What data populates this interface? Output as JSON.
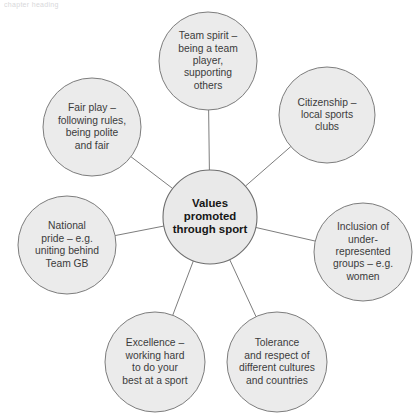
{
  "page": {
    "header_fragment": "chapter heading",
    "background_color": "#ffffff"
  },
  "diagram": {
    "type": "spider-radial",
    "node_fill_color": "#ebebeb",
    "node_stroke_color": "#7d7d7d",
    "text_color": "#3b3b3b",
    "center_text_color": "#161616",
    "center": {
      "label_lines": [
        "Values",
        "promoted",
        "through sport"
      ],
      "cx": 210,
      "cy": 217,
      "r": 47
    },
    "nodes": [
      {
        "id": "team-spirit",
        "label_lines": [
          "Team spirit –",
          "being a team",
          "player,",
          "supporting",
          "others"
        ],
        "cx": 208,
        "cy": 61,
        "r": 49
      },
      {
        "id": "citizenship",
        "label_lines": [
          "Citizenship –",
          "local sports",
          "clubs"
        ],
        "cx": 327,
        "cy": 115,
        "r": 48
      },
      {
        "id": "inclusion",
        "label_lines": [
          "Inclusion of",
          "under-",
          "represented",
          "groups – e.g.",
          "women"
        ],
        "cx": 363,
        "cy": 252,
        "r": 49
      },
      {
        "id": "tolerance",
        "label_lines": [
          "Tolerance",
          "and respect of",
          "different cultures",
          "and countries"
        ],
        "cx": 277,
        "cy": 362,
        "r": 50
      },
      {
        "id": "excellence",
        "label_lines": [
          "Excellence –",
          "working hard",
          "to do your",
          "best at a sport"
        ],
        "cx": 155,
        "cy": 362,
        "r": 50
      },
      {
        "id": "national-pride",
        "label_lines": [
          "National",
          "pride – e.g.",
          "uniting behind",
          "Team GB"
        ],
        "cx": 67,
        "cy": 245,
        "r": 49
      },
      {
        "id": "fair-play",
        "label_lines": [
          "Fair play –",
          "following rules,",
          "being polite",
          "and fair"
        ],
        "cx": 92,
        "cy": 127,
        "r": 49
      }
    ]
  }
}
